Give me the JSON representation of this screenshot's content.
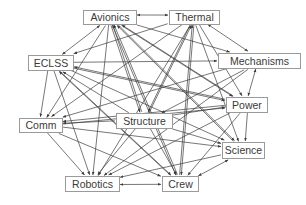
{
  "diagram": {
    "type": "directed-network",
    "colors": {
      "edge": "#3c3c3c",
      "node_border": "#9a9a9a",
      "node_fill": "#ffffff",
      "label": "#3a3a3a",
      "background": "#ffffff"
    },
    "nodes": [
      {
        "id": "avionics",
        "label": "Avionics",
        "x": 83,
        "y": 10,
        "w": 53,
        "h": 14
      },
      {
        "id": "thermal",
        "label": "Thermal",
        "x": 169,
        "y": 10,
        "w": 50,
        "h": 14
      },
      {
        "id": "eclss",
        "label": "ECLSS",
        "x": 28,
        "y": 55,
        "w": 45,
        "h": 15
      },
      {
        "id": "mechanisms",
        "label": "Mechanisms",
        "x": 218,
        "y": 53,
        "w": 82,
        "h": 15
      },
      {
        "id": "power",
        "label": "Power",
        "x": 226,
        "y": 97,
        "w": 41,
        "h": 15
      },
      {
        "id": "structure",
        "label": "Structure",
        "x": 116,
        "y": 113,
        "w": 56,
        "h": 15
      },
      {
        "id": "comm",
        "label": "Comm",
        "x": 19,
        "y": 118,
        "w": 43,
        "h": 14
      },
      {
        "id": "science",
        "label": "Science",
        "x": 222,
        "y": 142,
        "w": 42,
        "h": 16
      },
      {
        "id": "robotics",
        "label": "Robotics",
        "x": 65,
        "y": 176,
        "w": 54,
        "h": 15
      },
      {
        "id": "crew",
        "label": "Crew",
        "x": 162,
        "y": 176,
        "w": 36,
        "h": 15
      }
    ],
    "edges": [
      {
        "from": "avionics",
        "to": "thermal",
        "bidirectional": true
      },
      {
        "from": "avionics",
        "to": "eclss",
        "bidirectional": true
      },
      {
        "from": "avionics",
        "to": "mechanisms"
      },
      {
        "from": "avionics",
        "to": "power"
      },
      {
        "from": "avionics",
        "to": "structure"
      },
      {
        "from": "avionics",
        "to": "comm"
      },
      {
        "from": "avionics",
        "to": "science"
      },
      {
        "from": "avionics",
        "to": "robotics"
      },
      {
        "from": "avionics",
        "to": "crew"
      },
      {
        "from": "thermal",
        "to": "eclss"
      },
      {
        "from": "thermal",
        "to": "mechanisms",
        "bidirectional": true
      },
      {
        "from": "thermal",
        "to": "power"
      },
      {
        "from": "thermal",
        "to": "structure"
      },
      {
        "from": "thermal",
        "to": "comm"
      },
      {
        "from": "thermal",
        "to": "science"
      },
      {
        "from": "thermal",
        "to": "robotics"
      },
      {
        "from": "thermal",
        "to": "crew"
      },
      {
        "from": "eclss",
        "to": "mechanisms"
      },
      {
        "from": "eclss",
        "to": "power"
      },
      {
        "from": "eclss",
        "to": "comm"
      },
      {
        "from": "eclss",
        "to": "science"
      },
      {
        "from": "eclss",
        "to": "robotics"
      },
      {
        "from": "eclss",
        "to": "crew"
      },
      {
        "from": "mechanisms",
        "to": "power",
        "bidirectional": true
      },
      {
        "from": "mechanisms",
        "to": "comm"
      },
      {
        "from": "mechanisms",
        "to": "structure"
      },
      {
        "from": "mechanisms",
        "to": "robotics"
      },
      {
        "from": "power",
        "to": "avionics"
      },
      {
        "from": "power",
        "to": "eclss"
      },
      {
        "from": "power",
        "to": "comm"
      },
      {
        "from": "power",
        "to": "science"
      },
      {
        "from": "power",
        "to": "crew"
      },
      {
        "from": "power",
        "to": "robotics"
      },
      {
        "from": "structure",
        "to": "avionics"
      },
      {
        "from": "structure",
        "to": "thermal"
      },
      {
        "from": "structure",
        "to": "eclss"
      },
      {
        "from": "structure",
        "to": "power"
      },
      {
        "from": "structure",
        "to": "science"
      },
      {
        "from": "structure",
        "to": "comm"
      },
      {
        "from": "structure",
        "to": "robotics"
      },
      {
        "from": "structure",
        "to": "crew"
      },
      {
        "from": "comm",
        "to": "science"
      },
      {
        "from": "comm",
        "to": "robotics"
      },
      {
        "from": "comm",
        "to": "crew"
      },
      {
        "from": "comm",
        "to": "power"
      },
      {
        "from": "science",
        "to": "crew",
        "bidirectional": true
      },
      {
        "from": "science",
        "to": "avionics"
      },
      {
        "from": "science",
        "to": "robotics"
      },
      {
        "from": "robotics",
        "to": "crew",
        "bidirectional": true
      },
      {
        "from": "crew",
        "to": "avionics"
      },
      {
        "from": "crew",
        "to": "thermal"
      },
      {
        "from": "crew",
        "to": "eclss"
      }
    ]
  }
}
